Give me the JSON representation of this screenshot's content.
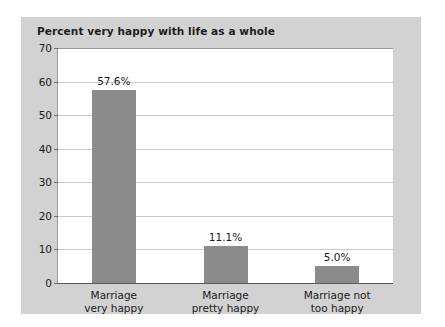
{
  "panel": {
    "background_color": "#d2d2d2",
    "plot_background_color": "#ffffff"
  },
  "chart_data": {
    "type": "bar",
    "title": "Percent very happy with life as a whole",
    "xlabel": "",
    "ylabel": "",
    "categories": [
      "Marriage very happy",
      "Marriage pretty happy",
      "Marriage not too happy"
    ],
    "category_lines": [
      [
        "Marriage",
        "very happy"
      ],
      [
        "Marriage",
        "pretty happy"
      ],
      [
        "Marriage not",
        "too happy"
      ]
    ],
    "values": [
      57.6,
      11.1,
      5.0
    ],
    "value_labels": [
      "57.6%",
      "11.1%",
      "5.0%"
    ],
    "ylim": [
      0,
      70
    ],
    "yticks": [
      70,
      60,
      50,
      40,
      30,
      20,
      10,
      0
    ],
    "ytick_labels": [
      "70",
      "60",
      "50",
      "40",
      "30",
      "20",
      "10",
      "0"
    ],
    "grid": true,
    "legend": null,
    "bar_color": "#8b8b8b",
    "gridline_color": "#c9c9c9"
  }
}
